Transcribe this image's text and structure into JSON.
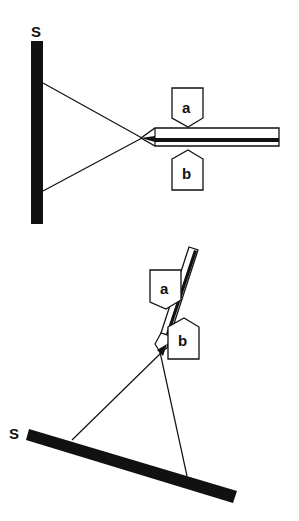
{
  "diagram": {
    "colors": {
      "ink": "#111111",
      "background": "#ffffff"
    },
    "top": {
      "screen_label": "S",
      "electrode_upper_label": "a",
      "electrode_lower_label": "b",
      "description": "Horizontal rod with pointed tip between electrodes a (above) and b (below); rays from tip diverge to vertical screen S"
    },
    "bottom": {
      "screen_label": "S",
      "electrode_upper_label": "a",
      "electrode_lower_label": "b",
      "description": "Rod tilted near vertical between electrodes a and b; rays from tip diverge to tilted screen S"
    }
  }
}
